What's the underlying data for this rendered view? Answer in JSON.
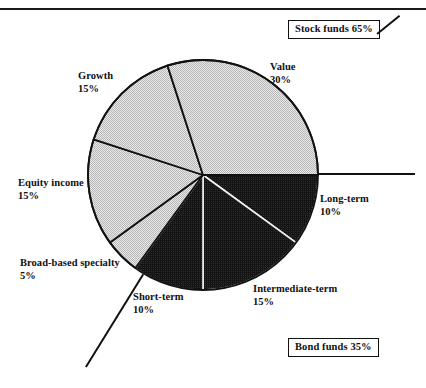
{
  "chart_data": {
    "type": "pie",
    "title": "",
    "subtitle": "",
    "xlabel": "",
    "ylabel": "",
    "legend_position": "none",
    "grid": false,
    "start_angle_deg": 0,
    "direction": "clockwise",
    "categories": [
      "Long-term",
      "Intermediate-term",
      "Short-term",
      "Broad-based specialty",
      "Equity income",
      "Growth",
      "Value"
    ],
    "values": [
      10,
      15,
      10,
      5,
      15,
      15,
      30
    ],
    "units": "%",
    "groups": [
      {
        "name": "Bond funds",
        "total": 35,
        "members": [
          "Long-term",
          "Intermediate-term",
          "Short-term"
        ],
        "fill": "dark"
      },
      {
        "name": "Stock funds",
        "total": 65,
        "members": [
          "Broad-based specialty",
          "Equity income",
          "Growth",
          "Value"
        ],
        "fill": "light"
      }
    ],
    "slices": [
      {
        "label": "Long-term",
        "percent": 10,
        "percent_text": "10%",
        "fill": "dark"
      },
      {
        "label": "Intermediate-term",
        "percent": 15,
        "percent_text": "15%",
        "fill": "dark"
      },
      {
        "label": "Short-term",
        "percent": 10,
        "percent_text": "10%",
        "fill": "dark"
      },
      {
        "label": "Broad-based specialty",
        "percent": 5,
        "percent_text": "5%",
        "fill": "light"
      },
      {
        "label": "Equity income",
        "percent": 15,
        "percent_text": "15%",
        "fill": "light"
      },
      {
        "label": "Growth",
        "percent": 15,
        "percent_text": "15%",
        "fill": "light"
      },
      {
        "label": "Value",
        "percent": 30,
        "percent_text": "30%",
        "fill": "light"
      }
    ]
  },
  "callouts": {
    "stock": "Stock funds 65%",
    "bond": "Bond funds 35%"
  },
  "labels": {
    "value": {
      "name": "Value",
      "percent": "30%"
    },
    "growth": {
      "name": "Growth",
      "percent": "15%"
    },
    "equity": {
      "name": "Equity income",
      "percent": "15%"
    },
    "broad": {
      "name": "Broad-based specialty",
      "percent": "5%"
    },
    "shortterm": {
      "name": "Short-term",
      "percent": "10%"
    },
    "intermediate": {
      "name": "Intermediate-term",
      "percent": "15%"
    },
    "longterm": {
      "name": "Long-term",
      "percent": "10%"
    }
  },
  "colors": {
    "stock_fill": "#d9d9d9",
    "bond_fill": "#1c1c1c",
    "outline": "#111111",
    "background": "#ffffff",
    "separator_light": "#111111",
    "separator_dark": "#f2f2f2"
  }
}
